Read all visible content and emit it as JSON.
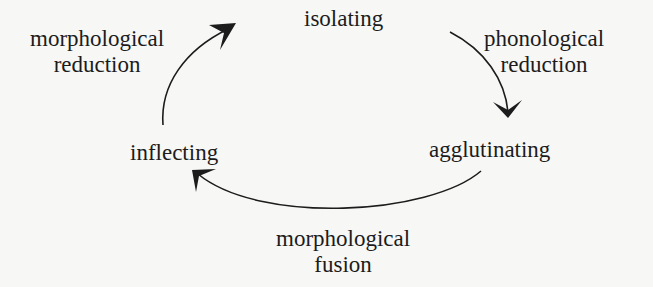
{
  "diagram": {
    "type": "cycle",
    "nodes": {
      "isolating": "isolating",
      "agglutinating": "agglutinating",
      "inflecting": "inflecting"
    },
    "edges": [
      {
        "from": "isolating",
        "to": "agglutinating",
        "label_line1": "phonological",
        "label_line2": "reduction"
      },
      {
        "from": "agglutinating",
        "to": "inflecting",
        "label_line1": "morphological",
        "label_line2": "fusion"
      },
      {
        "from": "inflecting",
        "to": "isolating",
        "label_line1": "morphological",
        "label_line2": "reduction"
      }
    ],
    "colors": {
      "ink": "#1c1c1c",
      "background": "#f7f7f5"
    }
  }
}
